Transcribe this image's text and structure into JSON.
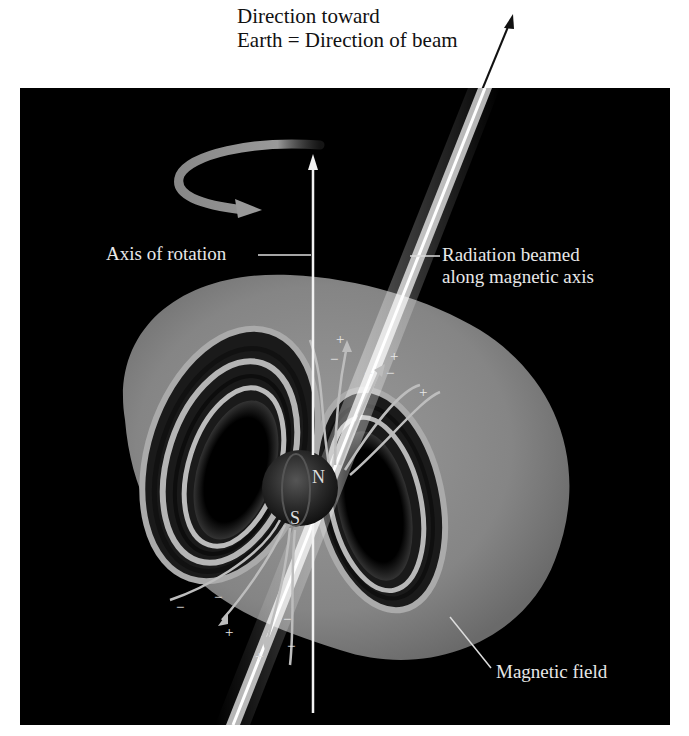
{
  "title_caption": {
    "line1": "Direction toward",
    "line2": "Earth = Direction of beam"
  },
  "labels": {
    "axis_of_rotation": "Axis of rotation",
    "radiation_line1": "Radiation beamed",
    "radiation_line2": "along magnetic axis",
    "magnetic_field": "Magnetic field",
    "north_pole": "N",
    "south_pole": "S"
  },
  "charges": {
    "plus": "+",
    "minus": "−"
  },
  "colors": {
    "background_panel": "#000000",
    "field_surface": "#8a8a8a",
    "beam": "#ffffff",
    "text_light": "#e8e8e8",
    "text_dark": "#111111"
  }
}
